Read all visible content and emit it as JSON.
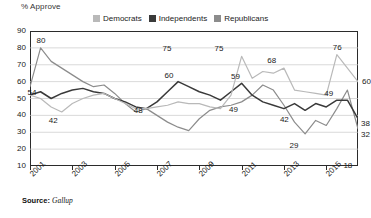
{
  "axis_title": "% Approve",
  "legend": {
    "items": [
      {
        "label": "Democrats",
        "color": "#b9b9b9"
      },
      {
        "label": "Independents",
        "color": "#3a3a3a"
      },
      {
        "label": "Republicans",
        "color": "#8c8c8c"
      }
    ]
  },
  "source": {
    "prefix": "Source:",
    "name": "Gallup"
  },
  "chart_data": {
    "type": "line",
    "title": "",
    "subtitle": "",
    "xlabel": "",
    "ylabel": "% Approve",
    "ylim": [
      10,
      90
    ],
    "ytick_step": 10,
    "yticks": [
      90,
      80,
      70,
      60,
      50,
      40,
      30,
      20,
      10
    ],
    "grid": true,
    "legend_position": "top",
    "x_tick_labels": [
      "2001",
      "2003",
      "2005",
      "2007",
      "2009",
      "2011",
      "2013",
      "2015"
    ],
    "x_tick_values": [
      2001,
      2003,
      2005,
      2007,
      2009,
      2011,
      2013,
      2015
    ],
    "xlim": [
      2001,
      2016.5
    ],
    "x": [
      2001,
      2001.5,
      2002,
      2002.5,
      2003,
      2003.5,
      2004,
      2004.5,
      2005,
      2005.5,
      2006,
      2006.5,
      2007,
      2007.5,
      2008,
      2008.5,
      2009,
      2009.5,
      2010,
      2010.5,
      2011,
      2011.5,
      2012,
      2012.5,
      2013,
      2013.5,
      2014,
      2014.5,
      2015,
      2015.5,
      2016,
      2016.5
    ],
    "series": [
      {
        "name": "Republicans",
        "color": "#8c8c8c",
        "values": [
          57,
          80,
          72,
          68,
          64,
          60,
          57,
          58,
          53,
          47,
          42,
          44,
          40,
          36,
          33,
          31,
          38,
          43,
          45,
          46,
          48,
          52,
          58,
          55,
          46,
          36,
          29,
          37,
          34,
          44,
          55,
          32
        ]
      },
      {
        "name": "Independents",
        "color": "#3a3a3a",
        "values": [
          52,
          54,
          50,
          53,
          55,
          56,
          54,
          53,
          50,
          48,
          45,
          44,
          48,
          54,
          60,
          57,
          54,
          52,
          49,
          54,
          59,
          52,
          48,
          46,
          44,
          47,
          43,
          47,
          45,
          49,
          49,
          38
        ]
      },
      {
        "name": "Democrats",
        "color": "#b9b9b9",
        "values": [
          52,
          50,
          45,
          42,
          47,
          50,
          52,
          53,
          50,
          47,
          44,
          44,
          45,
          46,
          48,
          47,
          47,
          45,
          44,
          52,
          75,
          62,
          66,
          65,
          68,
          55,
          54,
          53,
          52,
          76,
          68,
          60
        ]
      }
    ],
    "point_labels": [
      {
        "series": "Republicans",
        "x": 2001.5,
        "value": 80,
        "text": "80"
      },
      {
        "series": "Independents",
        "x": 2001.5,
        "value": 54,
        "text": "54"
      },
      {
        "series": "Democrats",
        "x": 2002.5,
        "value": 42,
        "text": "42"
      },
      {
        "series": "Democrats",
        "x": 2006,
        "value": 48,
        "text": "48"
      },
      {
        "series": "Republicans",
        "x": 2007.5,
        "value": 75,
        "text": "75"
      },
      {
        "series": "Independents",
        "x": 2007.5,
        "value": 60,
        "text": "60"
      },
      {
        "series": "Republicans",
        "x": 2010,
        "value": 75,
        "text": "75"
      },
      {
        "series": "Independents",
        "x": 2010.5,
        "value": 59,
        "text": "59"
      },
      {
        "series": "Democrats",
        "x": 2010.5,
        "value": 49,
        "text": "49"
      },
      {
        "series": "Republicans",
        "x": 2012.5,
        "value": 68,
        "text": "68"
      },
      {
        "series": "Democrats",
        "x": 2013,
        "value": 42,
        "text": "42"
      },
      {
        "series": "Democrats",
        "x": 2013.5,
        "value": 29,
        "text": "29"
      },
      {
        "series": "Republicans",
        "x": 2015.5,
        "value": 76,
        "text": "76"
      },
      {
        "series": "Independents",
        "x": 2015,
        "value": 49,
        "text": "49"
      },
      {
        "series": "Democrats",
        "x": 2016,
        "value": 18,
        "text": "18"
      },
      {
        "series": "Republicans",
        "x": 2016.5,
        "value": 60,
        "text": "60"
      },
      {
        "series": "Independents",
        "x": 2016.5,
        "value": 38,
        "text": "38"
      },
      {
        "series": "Democrats",
        "x": 2016.5,
        "value": 32,
        "text": "32"
      }
    ]
  }
}
